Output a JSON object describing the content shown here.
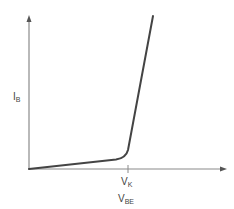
{
  "diagram": {
    "y_axis": {
      "label": "I",
      "label_sub": "B"
    },
    "x_axis": {
      "label": "V",
      "label_sub": "BE"
    },
    "knee": {
      "label": "V",
      "label_sub": "K"
    },
    "colors": {
      "axis": "#8a8a8a",
      "curve": "#444444",
      "text": "#444444"
    }
  }
}
